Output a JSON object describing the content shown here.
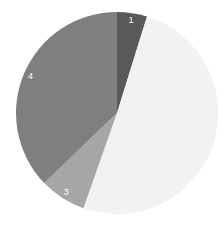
{
  "chart_data": {
    "type": "pie",
    "title": "",
    "categories": [
      "1",
      "2",
      "3",
      "4"
    ],
    "values": [
      4.8,
      50.6,
      7.4,
      37.2
    ],
    "colors": [
      "#595959",
      "#f2f2f2",
      "#a6a6a6",
      "#7f7f7f"
    ],
    "labels_shown": [
      "1",
      "",
      "3",
      "4"
    ],
    "start_angle": "12 o'clock",
    "direction": "clockwise",
    "legend": "none"
  }
}
